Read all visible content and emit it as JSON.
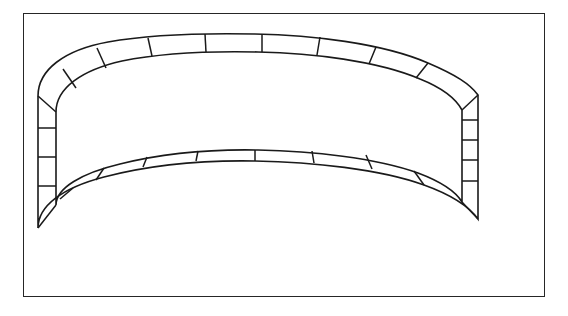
{
  "figure": {
    "title": "Segmented annular band diagram",
    "background_color": "#ffffff",
    "line_color": "#1a1a1a",
    "frame_color": "#262626",
    "frame": {
      "x": 23,
      "y": 13,
      "width": 522,
      "height": 284,
      "stroke_width": 1.5
    },
    "band": {
      "outer_path_points": [
        [
          38,
          96
        ],
        [
          40,
          84
        ],
        [
          47,
          71
        ],
        [
          60,
          59
        ],
        [
          79,
          49
        ],
        [
          104,
          42
        ],
        [
          134,
          37
        ],
        [
          168,
          35
        ],
        [
          205,
          34
        ],
        [
          245,
          34
        ],
        [
          286,
          35
        ],
        [
          325,
          38
        ],
        [
          361,
          43
        ],
        [
          393,
          50
        ],
        [
          419,
          59
        ],
        [
          440,
          70
        ],
        [
          455,
          82
        ],
        [
          463,
          95
        ],
        [
          478,
          95
        ],
        [
          478,
          112
        ],
        [
          478,
          134
        ],
        [
          478,
          158
        ],
        [
          478,
          182
        ],
        [
          478,
          200
        ],
        [
          478,
          219
        ],
        [
          462,
          219
        ],
        [
          455,
          207
        ],
        [
          441,
          196
        ],
        [
          420,
          186
        ],
        [
          393,
          177
        ],
        [
          361,
          170
        ],
        [
          325,
          165
        ],
        [
          286,
          162
        ],
        [
          245,
          161
        ],
        [
          205,
          161
        ],
        [
          168,
          163
        ],
        [
          134,
          167
        ],
        [
          104,
          173
        ],
        [
          79,
          181
        ],
        [
          60,
          191
        ],
        [
          47,
          203
        ],
        [
          40,
          216
        ],
        [
          38,
          228
        ]
      ],
      "outer_curve_top": {
        "left_x": 38,
        "left_y": 96,
        "apex_x": 255,
        "apex_y": 34,
        "right_x": 478,
        "right_y": 95
      },
      "inner_curve_top": {
        "left_x": 56,
        "left_y": 112,
        "apex_x": 258,
        "apex_y": 52,
        "right_x": 462,
        "right_y": 110
      },
      "outer_curve_bottom": {
        "left_x": 38,
        "left_y": 228,
        "nadir_x": 252,
        "nadir_y": 244,
        "right_x": 478,
        "right_y": 219
      },
      "inner_curve_bottom": {
        "left_x": 56,
        "left_y": 205,
        "nadir_x": 252,
        "nadir_y": 226,
        "right_x": 462,
        "right_y": 202
      },
      "left_side": {
        "outer_x": 38,
        "inner_x": 56,
        "top_y": 96,
        "bottom_y": 228,
        "divider_count": 4
      },
      "right_side": {
        "outer_x": 478,
        "inner_x": 462,
        "top_y": 95,
        "bottom_y": 219,
        "divider_count": 5
      },
      "cell_count_top": 9,
      "cell_count_bottom": 9,
      "cell_count_left": 3,
      "cell_count_right": 5,
      "total_cells": 26,
      "stroke_width": 1.6
    }
  }
}
